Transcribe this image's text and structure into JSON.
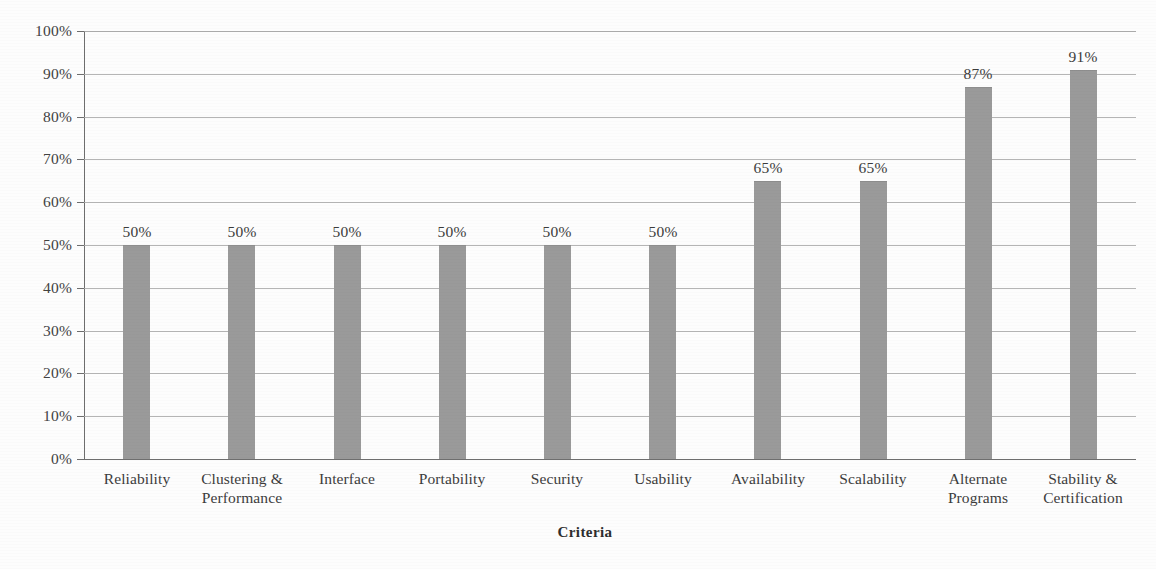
{
  "chart_data": {
    "type": "bar",
    "title": "",
    "subtitle": "",
    "xlabel": "Criteria",
    "ylabel": "",
    "ylim": [
      0,
      100
    ],
    "yunit": "%",
    "grid": true,
    "legend": "none",
    "bar_color": "#9a9a9a",
    "gridline_color": "#a8a8a8",
    "axis_color": "#6e6e6e",
    "background_color": "#fdfdfd",
    "ytick_labels": [
      "100%",
      "90%",
      "80%",
      "70%",
      "60%",
      "50%",
      "40%",
      "30%",
      "20%",
      "10%",
      "0%"
    ],
    "ytick_values": [
      100,
      90,
      80,
      70,
      60,
      50,
      40,
      30,
      20,
      10,
      0
    ],
    "categories": [
      "Reliability",
      "Clustering & Performance",
      "Interface",
      "Portability",
      "Security",
      "Usability",
      "Availability",
      "Scalability",
      "Alternate Programs",
      "Stability & Certification"
    ],
    "category_lines": [
      [
        "Reliability"
      ],
      [
        "Clustering &",
        "Performance"
      ],
      [
        "Interface"
      ],
      [
        "Portability"
      ],
      [
        "Security"
      ],
      [
        "Usability"
      ],
      [
        "Availability"
      ],
      [
        "Scalability"
      ],
      [
        "Alternate",
        "Programs"
      ],
      [
        "Stability &",
        "Certification"
      ]
    ],
    "values": [
      50,
      50,
      50,
      50,
      50,
      50,
      65,
      65,
      87,
      91
    ],
    "data_labels": [
      "50%",
      "50%",
      "50%",
      "50%",
      "50%",
      "50%",
      "65%",
      "65%",
      "87%",
      "91%"
    ]
  }
}
